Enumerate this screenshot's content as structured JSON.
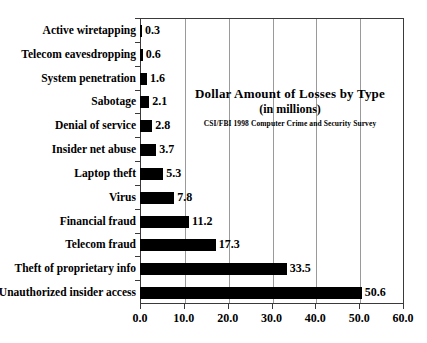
{
  "chart_data": {
    "type": "bar",
    "orientation": "horizontal",
    "title": "Dollar Amount of Losses by Type",
    "subtitle": "(in millions)",
    "source": "CSI/FBI 1998 Computer Crime and Security Survey",
    "xlabel": "",
    "ylabel": "",
    "xlim": [
      0,
      60
    ],
    "ylim": null,
    "grid": true,
    "grid_axis": "x",
    "legend": false,
    "legend_position": "none",
    "bar_color": "#000000",
    "categories": [
      "Active wiretapping",
      "Telecom eavesdropping",
      "System penetration",
      "Sabotage",
      "Denial of service",
      "Insider net abuse",
      "Laptop theft",
      "Virus",
      "Financial fraud",
      "Telecom fraud",
      "Theft of proprietary info",
      "Unauthorized insider access"
    ],
    "values": [
      0.3,
      0.6,
      1.6,
      2.1,
      2.8,
      3.7,
      5.3,
      7.8,
      11.2,
      17.3,
      33.5,
      50.6
    ],
    "value_labels": [
      "0.3",
      "0.6",
      "1.6",
      "2.1",
      "2.8",
      "3.7",
      "5.3",
      "7.8",
      "11.2",
      "17.3",
      "33.5",
      "50.6"
    ],
    "xticks": [
      0,
      10,
      20,
      30,
      40,
      50,
      60
    ],
    "xtick_labels": [
      "0.0",
      "10.0",
      "20.0",
      "30.0",
      "40.0",
      "50.0",
      "60.0"
    ]
  }
}
